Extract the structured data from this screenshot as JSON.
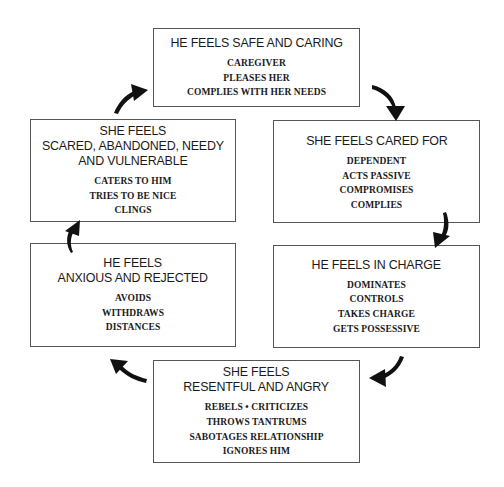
{
  "diagram": {
    "type": "cycle",
    "boxes": [
      {
        "id": "he-safe",
        "title": [
          "HE FEELS SAFE AND CARING"
        ],
        "items": [
          "CAREGIVER",
          "PLEASES HER",
          "COMPLIES WITH HER NEEDS"
        ]
      },
      {
        "id": "she-cared",
        "title": [
          "SHE FEELS CARED FOR"
        ],
        "items": [
          "DEPENDENT",
          "ACTS PASSIVE",
          "COMPROMISES",
          "COMPLIES"
        ]
      },
      {
        "id": "he-charge",
        "title": [
          "HE FEELS IN CHARGE"
        ],
        "items": [
          "DOMINATES",
          "CONTROLS",
          "TAKES CHARGE",
          "GETS POSSESSIVE"
        ]
      },
      {
        "id": "she-resentful",
        "title": [
          "SHE FEELS",
          "RESENTFUL AND ANGRY"
        ],
        "items": [
          "REBELS • CRITICIZES",
          "THROWS TANTRUMS",
          "SABOTAGES RELATIONSHIP",
          "IGNORES HIM"
        ]
      },
      {
        "id": "he-anxious",
        "title": [
          "HE FEELS",
          "ANXIOUS AND REJECTED"
        ],
        "items": [
          "AVOIDS",
          "WITHDRAWS",
          "DISTANCES"
        ]
      },
      {
        "id": "she-scared",
        "title": [
          "SHE FEELS",
          "SCARED, ABANDONED, NEEDY",
          "AND VULNERABLE"
        ],
        "items": [
          "CATERS TO HIM",
          "TRIES TO BE NICE",
          "CLINGS"
        ]
      }
    ],
    "arrows": [
      {
        "from": "he-safe",
        "to": "she-cared",
        "icon": "curved-arrow-down-right"
      },
      {
        "from": "she-cared",
        "to": "he-charge",
        "icon": "curved-arrow-down"
      },
      {
        "from": "he-charge",
        "to": "she-resentful",
        "icon": "curved-arrow-down-left"
      },
      {
        "from": "she-resentful",
        "to": "he-anxious",
        "icon": "curved-arrow-up-left"
      },
      {
        "from": "he-anxious",
        "to": "she-scared",
        "icon": "curved-arrow-up"
      },
      {
        "from": "she-scared",
        "to": "he-safe",
        "icon": "curved-arrow-up-right"
      }
    ],
    "colors": {
      "border": "#555555",
      "text": "#1a1a1a",
      "arrow": "#111111",
      "background": "#ffffff"
    }
  }
}
